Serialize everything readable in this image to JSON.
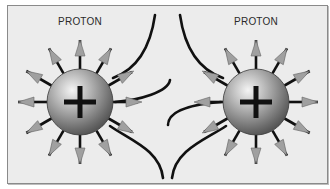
{
  "diagram": {
    "title": "",
    "particles": [
      {
        "label": "PROTON",
        "charge_symbol": "+",
        "center": [
          80,
          102
        ],
        "radius": 33
      },
      {
        "label": "PROTON",
        "charge_symbol": "+",
        "center": [
          256,
          102
        ],
        "radius": 33
      }
    ],
    "field_arrows_per_particle": 12,
    "field_lines": "repelling field lines curving away between the two protons",
    "colors": {
      "background": "#ececec",
      "frame_border": "#8a8a8a",
      "sphere_light": "#e8e8e8",
      "sphere_dark": "#5a5a5a",
      "arrow_fill": "#a0a0a0",
      "line": "#111111"
    }
  }
}
